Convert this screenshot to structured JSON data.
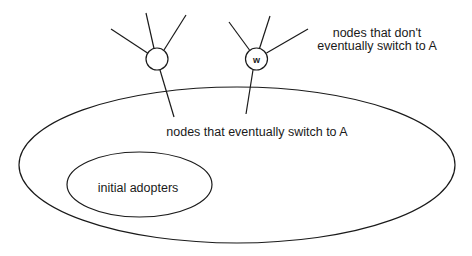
{
  "diagram": {
    "stroke_color": "#1a1a1a",
    "background": "#ffffff",
    "outer_set": {
      "label": "nodes that eventually switch to A",
      "ellipse": {
        "cx": 237,
        "cy": 165,
        "rx": 218,
        "ry": 78
      }
    },
    "inner_set": {
      "label": "initial adopters",
      "ellipse": {
        "cx": 139.5,
        "cy": 184.5,
        "rx": 72.5,
        "ry": 32.5
      }
    },
    "outside_label": {
      "line1": "nodes that don't",
      "line2": "eventually switch to A"
    },
    "nodes": [
      {
        "id": "left-node",
        "label": "",
        "cx": 157,
        "cy": 59,
        "r": 11
      },
      {
        "id": "w-node",
        "label": "w",
        "cx": 256,
        "cy": 59,
        "r": 11
      }
    ]
  }
}
